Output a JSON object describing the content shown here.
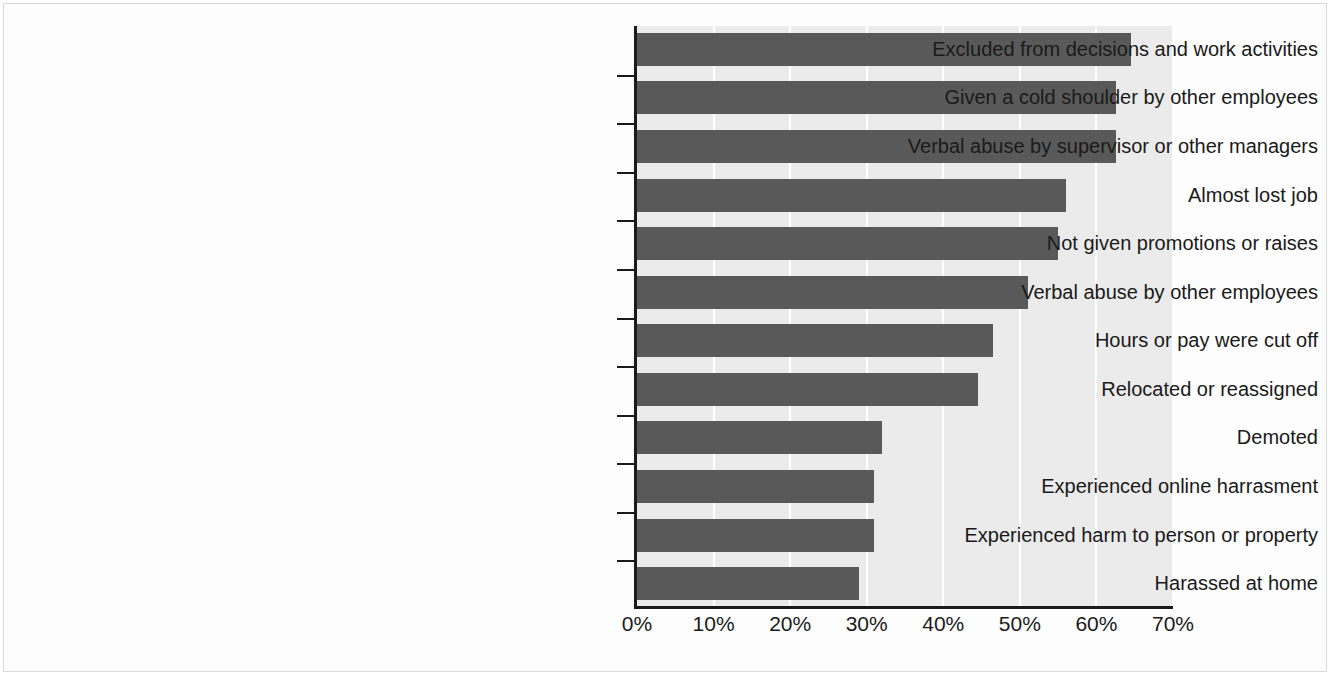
{
  "chart_data": {
    "type": "bar",
    "orientation": "horizontal",
    "title": "",
    "subtitle": "",
    "xlabel": "",
    "ylabel": "",
    "xlim": [
      0,
      70
    ],
    "grid": true,
    "legend": null,
    "tick_suffix": "%",
    "xticks": [
      0,
      10,
      20,
      30,
      40,
      50,
      60,
      70
    ],
    "xtick_labels": [
      "0%",
      "10%",
      "20%",
      "30%",
      "40%",
      "50%",
      "60%",
      "70%"
    ],
    "categories": [
      "Excluded from decisions and work activities",
      "Given a cold shoulder by other employees",
      "Verbal abuse by supervisor or other managers",
      "Almost lost job",
      "Not given promotions or raises",
      "Verbal abuse by other employees",
      "Hours or pay were cut off",
      "Relocated or reassigned",
      "Demoted",
      "Experienced online harrasment",
      "Experienced harm to person or property",
      "Harassed at home"
    ],
    "values": [
      64.5,
      62.5,
      62.5,
      56,
      55,
      51,
      46.5,
      44.5,
      32,
      31,
      31,
      29
    ],
    "colors": {
      "bar": "#595959",
      "plot_background": "#ebebeb",
      "gridline": "#ffffff",
      "axis": "#1a1a1a",
      "text": "#1a1a1a",
      "figure_background": "#ffffff"
    }
  }
}
